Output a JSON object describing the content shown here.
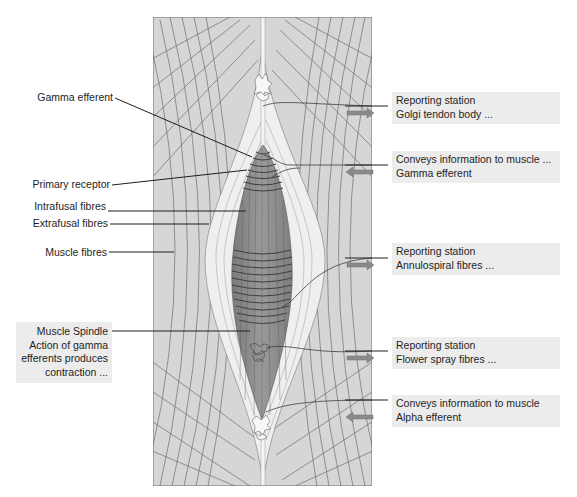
{
  "diagram": {
    "colors": {
      "background": "#ffffff",
      "muscle_fill": "#d6d6d6",
      "muscle_line": "#6a6a6a",
      "spindle_sheath": "#efefef",
      "spindle_fill": "#8d8d8d",
      "spindle_band": "#4a4a4a",
      "label_box_bg": "#ececec",
      "arrow": "#8a8a8a",
      "leader_line": "#1e1e1e"
    }
  },
  "left_labels": [
    {
      "id": "gamma-efferent",
      "text": "Gamma efferent"
    },
    {
      "id": "primary-receptor",
      "text": "Primary receptor"
    },
    {
      "id": "intrafusal-fibres",
      "text": "Intrafusal fibres"
    },
    {
      "id": "extrafusal-fibres",
      "text": "Extrafusal fibres"
    },
    {
      "id": "muscle-fibres",
      "text": "Muscle fibres"
    }
  ],
  "muscle_spindle_box": {
    "lines": [
      "Muscle Spindle",
      "Action of gamma",
      "efferents produces",
      "contraction ..."
    ]
  },
  "right_boxes": [
    {
      "id": "golgi",
      "line1": "Reporting station",
      "line2": "Golgi tendon body ...",
      "arrow": "right"
    },
    {
      "id": "gamma",
      "line1": "Conveys information to muscle ...",
      "line2": "Gamma efferent",
      "arrow": "left"
    },
    {
      "id": "annulospiral",
      "line1": "Reporting station",
      "line2": "Annulospiral fibres ...",
      "arrow": "right"
    },
    {
      "id": "flower-spray",
      "line1": "Reporting station",
      "line2": "Flower spray fibres ...",
      "arrow": "right"
    },
    {
      "id": "alpha",
      "line1": "Conveys information to muscle",
      "line2": "Alpha efferent",
      "arrow": "left"
    }
  ]
}
